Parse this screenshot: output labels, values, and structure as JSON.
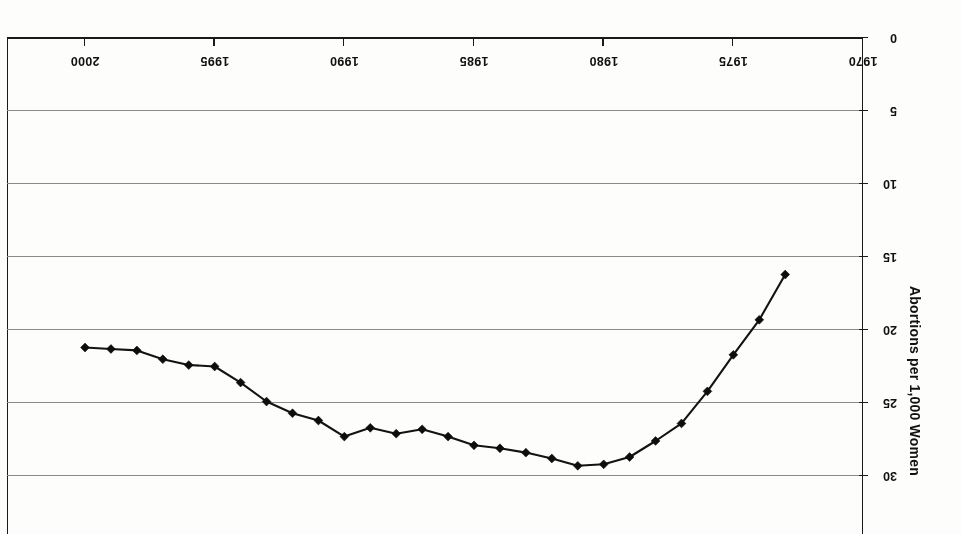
{
  "chart_data": {
    "type": "line",
    "title": "",
    "subtitle": "",
    "xlabel": "",
    "ylabel": "Abortions per 1,000 Women",
    "orientation_note": "image is scanned upside-down (rotated 180 degrees)",
    "x_tick_labels": [
      "2000",
      "1995",
      "1990",
      "1985",
      "1980",
      "1975",
      "1970"
    ],
    "x_tick_values": [
      2000,
      1995,
      1990,
      1985,
      1980,
      1975,
      1970
    ],
    "xlim": [
      2000,
      1970
    ],
    "y_tick_labels": [
      "0",
      "5",
      "10",
      "15",
      "20",
      "25",
      "30"
    ],
    "y_tick_values": [
      0,
      5,
      10,
      15,
      20,
      25,
      30
    ],
    "ylim": [
      0,
      35
    ],
    "y_axis_inverted": true,
    "grid": "horizontal",
    "legend": "none",
    "marker": "diamond",
    "line_color": "#131313",
    "grid_color": "#8a8a8a",
    "axis_color": "#1a1a1a",
    "background_color": "#fdfdfb",
    "x": [
      2000,
      1999,
      1998,
      1997,
      1996,
      1995,
      1994,
      1993,
      1992,
      1991,
      1990,
      1989,
      1988,
      1987,
      1986,
      1985,
      1984,
      1983,
      1982,
      1981,
      1980,
      1979,
      1978,
      1977,
      1976,
      1975,
      1974,
      1973
    ],
    "values": [
      21.2,
      21.3,
      21.4,
      22.0,
      22.4,
      22.5,
      23.6,
      24.9,
      25.7,
      26.2,
      27.3,
      26.7,
      27.1,
      26.8,
      27.3,
      27.9,
      28.1,
      28.4,
      28.8,
      29.3,
      29.2,
      28.7,
      27.6,
      26.4,
      24.2,
      21.7,
      19.3,
      16.2
    ],
    "series": [
      {
        "name": "Abortions per 1,000 Women",
        "values": [
          21.2,
          21.3,
          21.4,
          22.0,
          22.4,
          22.5,
          23.6,
          24.9,
          25.7,
          26.2,
          27.3,
          26.7,
          27.1,
          26.8,
          27.3,
          27.9,
          28.1,
          28.4,
          28.8,
          29.3,
          29.2,
          28.7,
          27.6,
          26.4,
          24.2,
          21.7,
          19.3,
          16.2
        ]
      }
    ]
  }
}
